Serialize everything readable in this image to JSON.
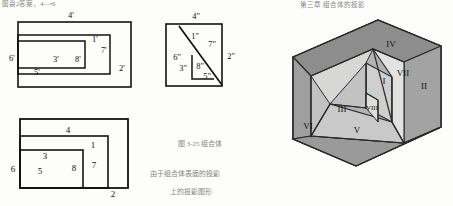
{
  "figure": {
    "kind": "engineering-drawing",
    "colors": {
      "line": "#121212",
      "paper": "#fdfdfc",
      "face_dark": "#8d8d8d",
      "face_mid": "#a8a8a8",
      "face_light": "#d2d2d2",
      "face_lightest": "#e2e2e0",
      "bleed": "#e9e9e6"
    }
  },
  "top_view": {
    "name": "top-view",
    "labels": [
      {
        "id": "t4",
        "text": "4'",
        "x": 71,
        "y": 15
      },
      {
        "id": "t6",
        "text": "6'",
        "x": 9,
        "y": 58
      },
      {
        "id": "t1",
        "text": "1'",
        "x": 95,
        "y": 39
      },
      {
        "id": "t7",
        "text": "7'",
        "x": 104,
        "y": 50
      },
      {
        "id": "t2",
        "text": "2'",
        "x": 124,
        "y": 69
      },
      {
        "id": "t3",
        "text": "3'",
        "x": 56,
        "y": 63
      },
      {
        "id": "t8",
        "text": "8'",
        "x": 78,
        "y": 63
      },
      {
        "id": "t5",
        "text": "5'",
        "x": 38,
        "y": 74
      }
    ]
  },
  "side_view": {
    "name": "side-view",
    "labels": [
      {
        "id": "s4",
        "text": "4\"",
        "x": 196,
        "y": 15
      },
      {
        "id": "s1",
        "text": "1\"",
        "x": 196,
        "y": 36
      },
      {
        "id": "s7",
        "text": "7\"",
        "x": 216,
        "y": 45
      },
      {
        "id": "s2",
        "text": "2\"",
        "x": 235,
        "y": 58
      },
      {
        "id": "s6",
        "text": "6\"",
        "x": 177,
        "y": 58
      },
      {
        "id": "s3",
        "text": "3\"",
        "x": 183,
        "y": 70
      },
      {
        "id": "s8",
        "text": "8\"",
        "x": 199,
        "y": 68
      },
      {
        "id": "s5",
        "text": "5\"",
        "x": 206,
        "y": 78
      }
    ]
  },
  "front_view": {
    "name": "front-view",
    "labels": [
      {
        "id": "f4",
        "text": "4",
        "x": 68,
        "y": 130
      },
      {
        "id": "f6",
        "text": "6",
        "x": 12,
        "y": 170
      },
      {
        "id": "f1",
        "text": "1",
        "x": 93,
        "y": 146
      },
      {
        "id": "f7",
        "text": "7",
        "x": 93,
        "y": 165
      },
      {
        "id": "f2",
        "text": "2",
        "x": 113,
        "y": 196
      },
      {
        "id": "f3",
        "text": "3",
        "x": 44,
        "y": 157
      },
      {
        "id": "f5",
        "text": "5",
        "x": 40,
        "y": 173
      },
      {
        "id": "f8",
        "text": "8",
        "x": 73,
        "y": 169
      }
    ]
  },
  "isometric_view": {
    "name": "isometric-view",
    "labels": [
      {
        "id": "iv",
        "text": "IV",
        "x": 390,
        "y": 44
      },
      {
        "id": "ivii",
        "text": "VII",
        "x": 405,
        "y": 73
      },
      {
        "id": "iii2",
        "text": "II",
        "x": 424,
        "y": 86
      },
      {
        "id": "ii",
        "text": "I",
        "x": 385,
        "y": 81
      },
      {
        "id": "iii",
        "text": "III",
        "x": 342,
        "y": 109
      },
      {
        "id": "iviii",
        "text": "VIII",
        "x": 372,
        "y": 108
      },
      {
        "id": "ivi",
        "text": "VI",
        "x": 309,
        "y": 126
      },
      {
        "id": "iv5",
        "text": "V",
        "x": 357,
        "y": 130
      }
    ]
  },
  "scan_artifacts": [
    {
      "id": "a1",
      "text": "图袅2答案，4—•6",
      "x": 2,
      "y": -1
    },
    {
      "id": "a2",
      "text": "第三章 组合体的投影",
      "x": 300,
      "y": 2
    },
    {
      "id": "a3",
      "text": "图 3-25 组合体",
      "x": 178,
      "y": 146
    },
    {
      "id": "a4",
      "text": "由于组合体表面的投影",
      "x": 150,
      "y": 174
    },
    {
      "id": "a5",
      "text": "上的投影图形",
      "x": 170,
      "y": 192
    }
  ]
}
